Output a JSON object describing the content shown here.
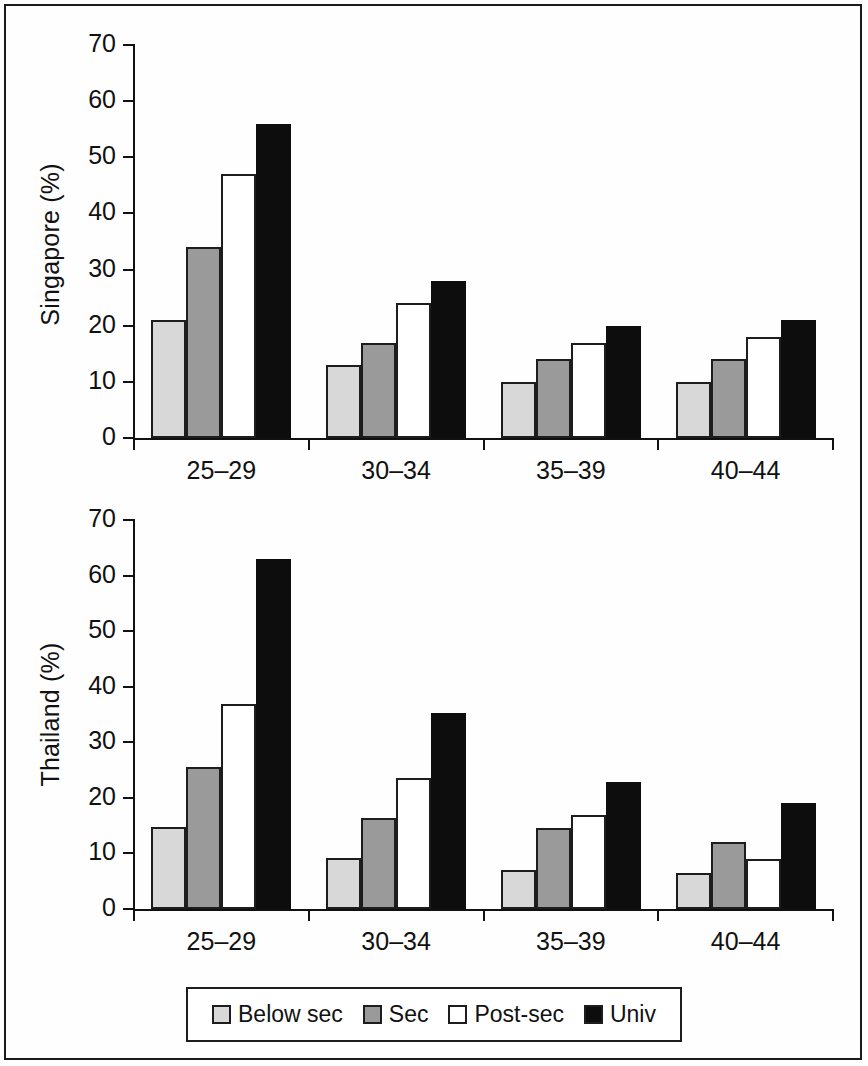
{
  "figure": {
    "frame_color": "#1a1a1a",
    "background": "#ffffff"
  },
  "legend": {
    "position": "bottom",
    "entries": [
      {
        "label": "Below sec",
        "color": "#d8d8d8"
      },
      {
        "label": "Sec",
        "color": "#9a9a9a"
      },
      {
        "label": "Post-sec",
        "color": "#ffffff"
      },
      {
        "label": "Univ",
        "color": "#0d0d0d"
      }
    ]
  },
  "panels": [
    {
      "id": "singapore",
      "ylabel": "Singapore (%)",
      "categories": [
        "25–29",
        "30–34",
        "35–39",
        "40–44"
      ],
      "yticks": [
        "0",
        "10",
        "20",
        "30",
        "40",
        "50",
        "60",
        "70"
      ]
    },
    {
      "id": "thailand",
      "ylabel": "Thailand (%)",
      "categories": [
        "25–29",
        "30–34",
        "35–39",
        "40–44"
      ],
      "yticks": [
        "0",
        "10",
        "20",
        "30",
        "40",
        "50",
        "60",
        "70"
      ]
    }
  ],
  "chart_data": [
    {
      "type": "bar",
      "title": "",
      "xlabel": "",
      "ylabel": "Singapore (%)",
      "ylim": [
        0,
        70
      ],
      "yticks": [
        0,
        10,
        20,
        30,
        40,
        50,
        60,
        70
      ],
      "grid": false,
      "legend_position": "bottom",
      "categories": [
        "25–29",
        "30–34",
        "35–39",
        "40–44"
      ],
      "series": [
        {
          "name": "Below sec",
          "color": "#d8d8d8",
          "values": [
            21,
            13,
            10,
            10
          ]
        },
        {
          "name": "Sec",
          "color": "#9a9a9a",
          "values": [
            34,
            17,
            14,
            14
          ]
        },
        {
          "name": "Post-sec",
          "color": "#ffffff",
          "values": [
            47,
            24,
            17,
            18
          ]
        },
        {
          "name": "Univ",
          "color": "#0d0d0d",
          "values": [
            56,
            28,
            20,
            21
          ]
        }
      ]
    },
    {
      "type": "bar",
      "title": "",
      "xlabel": "",
      "ylabel": "Thailand (%)",
      "ylim": [
        0,
        70
      ],
      "yticks": [
        0,
        10,
        20,
        30,
        40,
        50,
        60,
        70
      ],
      "grid": false,
      "legend_position": "bottom",
      "categories": [
        "25–29",
        "30–34",
        "35–39",
        "40–44"
      ],
      "series": [
        {
          "name": "Below sec",
          "color": "#d8d8d8",
          "values": [
            14.8,
            9.2,
            7.0,
            6.5
          ]
        },
        {
          "name": "Sec",
          "color": "#9a9a9a",
          "values": [
            25.6,
            16.4,
            14.5,
            12.1
          ]
        },
        {
          "name": "Post-sec",
          "color": "#ffffff",
          "values": [
            36.8,
            23.6,
            17.0,
            9.0
          ]
        },
        {
          "name": "Univ",
          "color": "#0d0d0d",
          "values": [
            63.0,
            35.2,
            22.9,
            19.0
          ]
        }
      ]
    }
  ]
}
